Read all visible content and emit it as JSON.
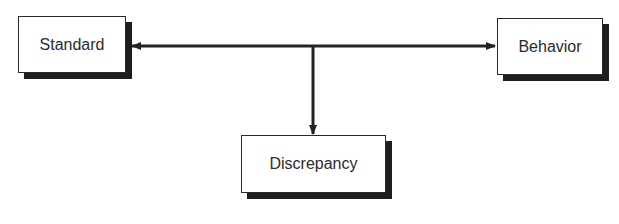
{
  "diagram": {
    "nodes": [
      {
        "id": "standard",
        "label": "Standard"
      },
      {
        "id": "behavior",
        "label": "Behavior"
      },
      {
        "id": "discrepancy",
        "label": "Discrepancy"
      }
    ],
    "edges": [
      {
        "from": "center",
        "to": "standard",
        "type": "arrow"
      },
      {
        "from": "center",
        "to": "behavior",
        "type": "arrow"
      },
      {
        "from": "center",
        "to": "discrepancy",
        "type": "arrow"
      }
    ],
    "colors": {
      "line": "#222222",
      "shadow": "#1e1e1e",
      "box_fill": "#ffffff",
      "text": "#2b2b2b"
    }
  }
}
